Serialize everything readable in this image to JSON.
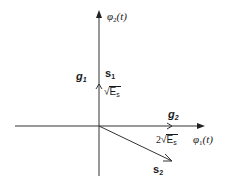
{
  "diagram": {
    "type": "signal-space-constellation",
    "axes": {
      "vertical": {
        "label_base": "φ",
        "label_sub": "2",
        "label_arg": "(t)"
      },
      "horizontal": {
        "label_base": "φ",
        "label_sub": "1",
        "label_arg": "(t)"
      }
    },
    "vectors": [
      {
        "name": "s1",
        "label_base": "s",
        "label_sub": "1",
        "magnitude_prefix": "",
        "magnitude_radicand_base": "E",
        "magnitude_radicand_sub": "s",
        "direction": "along φ2"
      },
      {
        "name": "s2",
        "label_base": "s",
        "label_sub": "2",
        "direction": "below φ1"
      }
    ],
    "basis": [
      {
        "name": "g1",
        "label_base": "g",
        "label_sub": "1"
      },
      {
        "name": "g2",
        "label_base": "g",
        "label_sub": "2",
        "magnitude_prefix": "2",
        "magnitude_radicand_base": "E",
        "magnitude_radicand_sub": "s"
      }
    ],
    "colors": {
      "stroke": "#333333",
      "text": "#1a1a1a",
      "background": "#ffffff"
    }
  }
}
